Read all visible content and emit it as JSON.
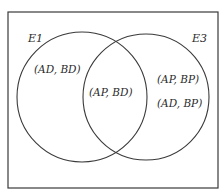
{
  "diagram": {
    "type": "venn",
    "universe": {
      "x": 8,
      "y": 12,
      "width": 210,
      "height": 176,
      "stroke": "#3a3a3a"
    },
    "sets": [
      {
        "label": "E1",
        "cx": 82,
        "cy": 97,
        "r": 65,
        "stroke": "#3a3a3a"
      },
      {
        "label": "E3",
        "cx": 146,
        "cy": 97,
        "r": 63,
        "stroke": "#3a3a3a"
      }
    ],
    "regions": {
      "e1_only": [
        "(AD, BD)"
      ],
      "intersection": [
        "(AP, BD)"
      ],
      "e3_only": [
        "(AP, BP)",
        "(AD, BP)"
      ]
    }
  }
}
